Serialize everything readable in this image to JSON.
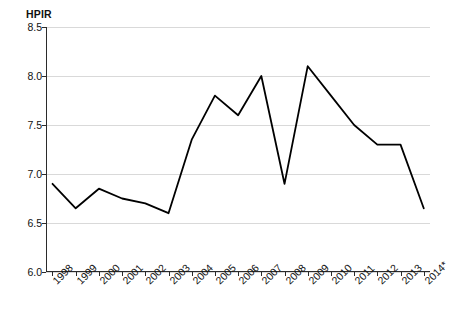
{
  "chart_data": {
    "type": "line",
    "title": "",
    "subtitle": "",
    "ylabel": "HPIR",
    "xlabel": "",
    "categories": [
      "1998",
      "1999",
      "2000",
      "2001",
      "2002",
      "2003",
      "2004",
      "2005",
      "2006",
      "2007",
      "2008",
      "2009",
      "2010",
      "2011",
      "2012",
      "2013",
      "2014*"
    ],
    "values": [
      6.9,
      6.65,
      6.85,
      6.75,
      6.7,
      6.6,
      7.35,
      7.8,
      7.6,
      8.0,
      6.9,
      8.1,
      7.8,
      7.5,
      7.3,
      7.3,
      6.65
    ],
    "series": [
      {
        "name": "HPIR",
        "values": [
          6.9,
          6.65,
          6.85,
          6.75,
          6.7,
          6.6,
          7.35,
          7.8,
          7.6,
          8.0,
          6.9,
          8.1,
          7.8,
          7.5,
          7.3,
          7.3,
          6.65
        ]
      }
    ],
    "ylim": [
      6.0,
      8.5
    ],
    "yticks": [
      "6.0",
      "6.5",
      "7.0",
      "7.5",
      "8.0",
      "8.5"
    ],
    "ytick_values": [
      6.0,
      6.5,
      7.0,
      7.5,
      8.0,
      8.5
    ],
    "grid": true,
    "grid_axis": "y",
    "legend": "none",
    "line_color": "#000000",
    "grid_color": "#d9d9d9",
    "axis_color": "#2b2b2b"
  }
}
